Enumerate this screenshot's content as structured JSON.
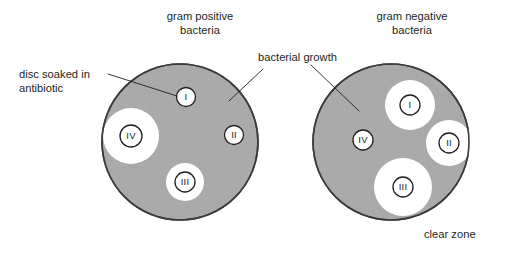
{
  "figure": {
    "width": 517,
    "height": 257,
    "background": "#ffffff"
  },
  "colors": {
    "background": "#ffffff",
    "bacterial_growth_fill": "#a8a8a8",
    "clear_zone_fill": "#ffffff",
    "dish_outline": "#3a3a3a",
    "disc_outline": "#231f20",
    "text": "#231f20",
    "leader_line": "#231f20"
  },
  "titles": {
    "left_line1": "gram positive",
    "left_line2": "bacteria",
    "right_line1": "gram negative",
    "right_line2": "bacteria"
  },
  "annotations": {
    "disc_label_line1": "disc soaked in",
    "disc_label_line2": "antibiotic",
    "growth_label": "bacterial growth",
    "clear_zone_label": "clear zone"
  },
  "dishes": [
    {
      "id": "left",
      "name": "gram-positive-dish",
      "cx": 180,
      "cy": 142,
      "r": 78,
      "discs": [
        {
          "numeral": "I",
          "cx": 186,
          "cy": 97,
          "disc_r": 9.5,
          "zone_r": 0
        },
        {
          "numeral": "IV",
          "cx": 131,
          "cy": 136,
          "disc_r": 11,
          "zone_r": 28
        },
        {
          "numeral": "II",
          "cx": 234,
          "cy": 135,
          "disc_r": 9.5,
          "zone_r": 0
        },
        {
          "numeral": "III",
          "cx": 185,
          "cy": 182,
          "disc_r": 10,
          "zone_r": 19
        }
      ]
    },
    {
      "id": "right",
      "name": "gram-negative-dish",
      "cx": 391,
      "cy": 142,
      "r": 78,
      "discs": [
        {
          "numeral": "I",
          "cx": 410,
          "cy": 105,
          "disc_r": 10,
          "zone_r": 25
        },
        {
          "numeral": "IV",
          "cx": 363,
          "cy": 140,
          "disc_r": 10,
          "zone_r": 0
        },
        {
          "numeral": "II",
          "cx": 449,
          "cy": 143,
          "disc_r": 10,
          "zone_r": 23
        },
        {
          "numeral": "III",
          "cx": 403,
          "cy": 187,
          "disc_r": 10,
          "zone_r": 29
        }
      ]
    }
  ],
  "leader_lines": [
    {
      "name": "disc-soaked-leader",
      "x1": 108,
      "y1": 74,
      "x2": 177,
      "y2": 96
    },
    {
      "name": "bacterial-growth-leader-left",
      "x1": 263,
      "y1": 69,
      "x2": 229,
      "y2": 101
    },
    {
      "name": "bacterial-growth-leader-right",
      "x1": 311,
      "y1": 65,
      "x2": 359,
      "y2": 111
    }
  ]
}
